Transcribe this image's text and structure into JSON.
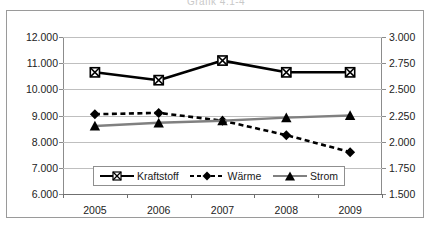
{
  "title": {
    "text": "Grafik 4.1-4",
    "clipped": true
  },
  "axes": {
    "left": {
      "ticks": [
        "6.000",
        "7.000",
        "8.000",
        "9.000",
        "10.000",
        "11.000",
        "12.000"
      ],
      "min": 6000,
      "max": 12000,
      "step": 1000
    },
    "right": {
      "ticks": [
        "1.500",
        "1.750",
        "2.000",
        "2.250",
        "2.500",
        "2.750",
        "3.000"
      ],
      "min": 1500,
      "max": 3000,
      "step": 250
    },
    "x": {
      "ticks": [
        "2005",
        "2006",
        "2007",
        "2008",
        "2009"
      ]
    }
  },
  "legend": {
    "items": [
      {
        "label": "Kraftstoff",
        "marker": "x-marker",
        "line": "solid",
        "color": "#000000"
      },
      {
        "label": "Wärme",
        "marker": "diamond-marker",
        "line": "dashed",
        "color": "#000000"
      },
      {
        "label": "Strom",
        "marker": "triangle-marker",
        "line": "solid",
        "color": "#808080"
      }
    ]
  },
  "colors": {
    "kraftstoff": "#000000",
    "waerme": "#000000",
    "strom": "#808080",
    "grid": "#bfbfbf",
    "axis": "#8c8c8c",
    "frame": "#9a9a9a"
  },
  "chart_data": {
    "type": "line",
    "title": "Grafik 4.1-4",
    "xlabel": "",
    "ylabel": "",
    "categories": [
      "2005",
      "2006",
      "2007",
      "2008",
      "2009"
    ],
    "grid": true,
    "legend_position": "bottom-inside",
    "ylim": [
      6000,
      12000
    ],
    "y2lim": [
      1500,
      3000
    ],
    "series": [
      {
        "name": "Kraftstoff",
        "axis": "left",
        "marker": "x",
        "linestyle": "solid",
        "color": "#000000",
        "values": [
          10650,
          10350,
          11100,
          10650,
          10650
        ]
      },
      {
        "name": "Wärme",
        "axis": "left",
        "marker": "diamond",
        "linestyle": "dashed",
        "color": "#000000",
        "values": [
          9050,
          9100,
          8800,
          8250,
          7600
        ]
      },
      {
        "name": "Strom",
        "axis": "right",
        "marker": "triangle",
        "linestyle": "solid",
        "color": "#808080",
        "values": [
          2150,
          2180,
          2200,
          2230,
          2250
        ]
      }
    ]
  }
}
